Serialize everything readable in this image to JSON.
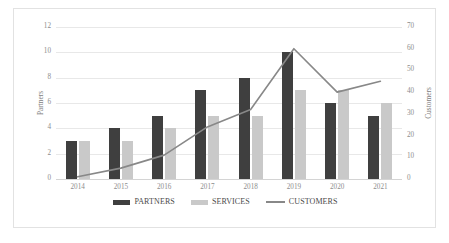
{
  "chart_data": {
    "type": "bar",
    "title": "",
    "subtitle": "",
    "xlabel": "",
    "ylabel": "Partners",
    "y2label": "Customers",
    "categories": [
      "2014",
      "2015",
      "2016",
      "2017",
      "2018",
      "2019",
      "2020",
      "2021"
    ],
    "series": [
      {
        "name": "PARTNERS",
        "type": "bar",
        "axis": "left",
        "color": "#3f3f3f",
        "values": [
          3,
          4,
          5,
          7,
          8,
          10,
          6,
          5
        ]
      },
      {
        "name": "SERVICES",
        "type": "bar",
        "axis": "left",
        "color": "#c9c9c9",
        "values": [
          3,
          3,
          4,
          5,
          5,
          7,
          7,
          6
        ]
      },
      {
        "name": "CUSTOMERS",
        "type": "line",
        "axis": "right",
        "color": "#888888",
        "values": [
          1,
          5,
          11,
          24,
          32,
          60,
          40,
          45
        ]
      }
    ],
    "ylim": [
      0,
      12
    ],
    "yticks": [
      0,
      2,
      4,
      6,
      8,
      10,
      12
    ],
    "y2lim": [
      0,
      70
    ],
    "y2ticks": [
      0,
      10,
      20,
      30,
      40,
      50,
      60,
      70
    ],
    "grid": true,
    "legend_position": "bottom",
    "legend_entries": [
      "PARTNERS",
      "SERVICES",
      "CUSTOMERS"
    ]
  },
  "axes": {
    "left_title": "Partners",
    "right_title": "Customers",
    "left_ticks": [
      "12",
      "10",
      "8",
      "6",
      "4",
      "2",
      "0"
    ],
    "right_ticks": [
      "70",
      "60",
      "50",
      "40",
      "30",
      "20",
      "10",
      "0"
    ]
  },
  "legend": {
    "items": [
      {
        "label": "PARTNERS",
        "marker": "bar-swatch-dark"
      },
      {
        "label": "SERVICES",
        "marker": "bar-swatch-light"
      },
      {
        "label": "CUSTOMERS",
        "marker": "line-swatch"
      }
    ]
  }
}
